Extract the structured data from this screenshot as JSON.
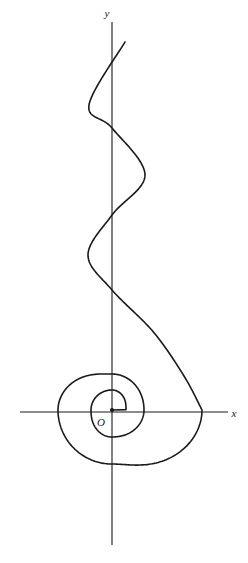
{
  "figure": {
    "background_color": "#ffffff",
    "stroke_color": "#1a1a1a",
    "axis_stroke_width": 1.1,
    "curve_stroke_width": 1.6,
    "width": 248,
    "height": 563
  },
  "labels": {
    "x_axis": "x",
    "y_axis": "y",
    "origin": "O"
  },
  "chart_data": {
    "type": "line",
    "title": "",
    "subtitle": "",
    "xlabel": "x",
    "ylabel": "y",
    "legend": [],
    "grid": false,
    "annotations": [
      "O"
    ],
    "origin_px": [
      112,
      410
    ],
    "axes": {
      "x_axis_px": {
        "y": 412,
        "x_start": 20,
        "x_end": 228,
        "arrowless": true
      },
      "y_axis_px": {
        "x": 112,
        "y_start": 22,
        "y_end": 545,
        "arrowless": true
      },
      "x_label_px": [
        234,
        417
      ],
      "y_label_px": [
        107,
        14
      ],
      "origin_label_px": [
        101,
        425
      ],
      "origin_dot_px": [
        112,
        410
      ],
      "origin_dot_r": 2.1
    },
    "axis_crossings_px": {
      "positive_y": [
        374,
        390
      ],
      "negative_y": [
        437,
        464
      ],
      "negative_x": [
        58,
        91
      ],
      "positive_x": [
        126,
        144,
        202
      ]
    },
    "spiral_samples_polar": [
      {
        "theta_deg": 0,
        "r_px": 14
      },
      {
        "theta_deg": 90,
        "r_px": 20
      },
      {
        "theta_deg": 180,
        "r_px": 21
      },
      {
        "theta_deg": 270,
        "r_px": 27
      },
      {
        "theta_deg": 360,
        "r_px": 32
      },
      {
        "theta_deg": 450,
        "r_px": 36
      },
      {
        "theta_deg": 540,
        "r_px": 54
      },
      {
        "theta_deg": 630,
        "r_px": 54
      },
      {
        "theta_deg": 720,
        "r_px": 90
      }
    ],
    "wave_samples_px": {
      "y_axis_crossings": [
        290,
        215,
        128
      ],
      "extrema": [
        {
          "x": 88,
          "y": 255,
          "side": "left"
        },
        {
          "x": 145,
          "y": 175,
          "side": "right"
        },
        {
          "x": 89,
          "y": 105,
          "side": "left"
        }
      ],
      "end_point": [
        125,
        42
      ]
    },
    "curve_path": "M 125 42 C 110 57 96 77 91 101 C 86 126 99 143 113 155 C 128 168 146 176 145 196 C 144 220 127 240 113 258 C 100 274 93 291 99 314 C 106 339 130 357 160 374 C 185 389 203 398 203 412 C 203 430 188 449 163 459 C 136 470 104 465 83 448 C 62 431 56 406 65 385 C 74 364 94 352 113 353 C 132 354 146 368 145 386 C 144 403 129 414 113 414 C 98 414 88 403 90 391 C 92 380 103 373 113 376 C 122 378 127 387 126 396 C 125 403 120 408 115 409"
  }
}
